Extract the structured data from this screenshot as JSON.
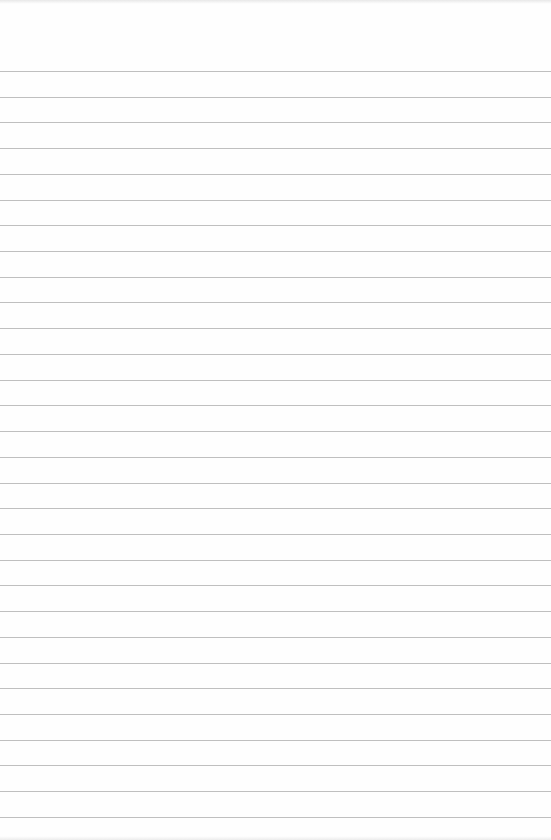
{
  "page": {
    "type": "lined-paper",
    "background_color": "#fefefe",
    "rule_color": "#b4b4b4",
    "rule_count": 30,
    "first_rule_y": 71,
    "rule_spacing": 25.72
  }
}
